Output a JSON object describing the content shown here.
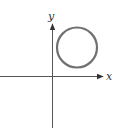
{
  "diagram": {
    "type": "coordinate-plane-with-circle",
    "axes": {
      "x_label": "x",
      "y_label": "y",
      "color": "#333333",
      "origin": [
        52.5,
        76.5
      ]
    },
    "circle": {
      "center": [
        77,
        47.5
      ],
      "radius": 20,
      "stroke_color": "#707070",
      "stroke_width": 2.2,
      "quadrant": "first"
    }
  }
}
